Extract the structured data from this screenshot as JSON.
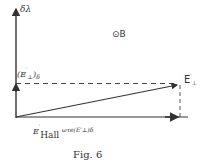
{
  "figure": {
    "caption": "Fig. 6",
    "axis_label": "δλ",
    "field_label": "⊙B",
    "vector_label": {
      "main": "E",
      "prime": "′",
      "sub": "⊥"
    },
    "vertical_projection_label": {
      "open": "(",
      "main": "E",
      "prime": "′",
      "sub": "⊥",
      "close": ")",
      "subscript": "δ"
    },
    "horizontal_label": {
      "e": "E",
      "prime": "′",
      "hall": "Hall",
      "omega_tau": "ωτ",
      "tau_sub": "e",
      "paren_open": "(",
      "inner": "E",
      "inner_prime": "′",
      "inner_sub": "⊥",
      "paren_close": ")",
      "delta": "δ"
    },
    "colors": {
      "line": "#333333",
      "background": "#ffffff"
    }
  }
}
